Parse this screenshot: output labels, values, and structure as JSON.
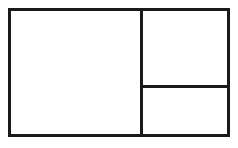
{
  "diagram": {
    "type": "panel-layout",
    "line_color": "#1a1a1a",
    "background": "#ffffff",
    "panels": [
      {
        "id": "left-large",
        "label": ""
      },
      {
        "id": "right-top",
        "label": ""
      },
      {
        "id": "right-bottom",
        "label": ""
      }
    ]
  }
}
